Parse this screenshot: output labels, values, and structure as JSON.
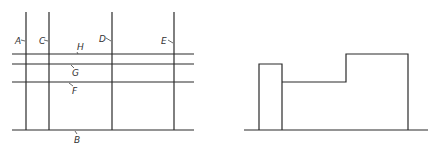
{
  "left_diagram": {
    "labels": {
      "A": "A",
      "B": "B",
      "C": "C",
      "D": "D",
      "E": "E",
      "F": "F",
      "G": "G",
      "H": "H"
    }
  },
  "right_diagram": {
    "description": "stepped building profile"
  }
}
